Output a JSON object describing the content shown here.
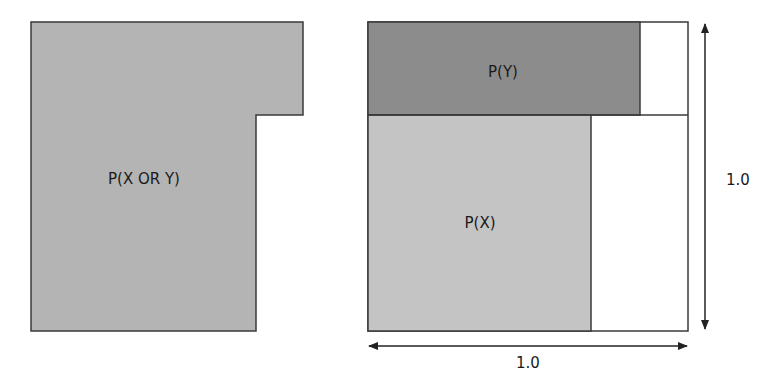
{
  "left_panel": {
    "union_region": {
      "label": "P(X OR Y)",
      "fill": "#b4b4b4",
      "stroke": "#3a3a3a"
    }
  },
  "right_panel": {
    "sample_space": {
      "fill": "#ffffff",
      "stroke": "#3a3a3a",
      "width_label": "1.0",
      "height_label": "1.0"
    },
    "region_y": {
      "label": "P(Y)",
      "fill": "#8c8c8c"
    },
    "region_x": {
      "label": "P(X)",
      "fill": "#c4c4c4"
    }
  },
  "colors": {
    "line": "#3a3a3a",
    "text": "#1a1a1a",
    "background": "#ffffff"
  }
}
